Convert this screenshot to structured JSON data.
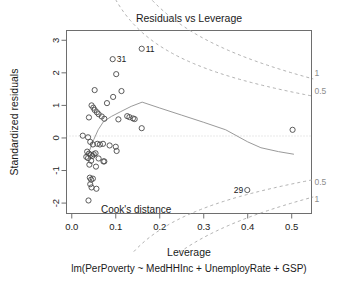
{
  "chart_data": {
    "type": "scatter",
    "title": "Residuals vs Leverage",
    "xlabel": "Leverage",
    "ylabel": "Standardized residuals",
    "subtitle": "lm(PerPoverty ~ MedHHInc + UnemployRate + GSP)",
    "xlim": [
      -0.012,
      0.545
    ],
    "ylim": [
      -2.32,
      3.3
    ],
    "xticks": [
      0.0,
      0.1,
      0.2,
      0.3,
      0.4,
      0.5
    ],
    "xtick_labels": [
      "0.0",
      "0.1",
      "0.2",
      "0.3",
      "0.4",
      "0.5"
    ],
    "yticks": [
      3,
      2,
      1,
      0,
      -1,
      -2
    ],
    "ytick_labels": [
      "3",
      "2",
      "1",
      "0",
      "-1",
      "-2"
    ],
    "grid": false,
    "legend": "none",
    "zero_reference_line": 0,
    "cooks_distance_annotation": "Cook's distance",
    "points": [
      {
        "x": 0.159,
        "y": 2.74,
        "label": "11"
      },
      {
        "x": 0.093,
        "y": 2.42,
        "label": "31"
      },
      {
        "x": 0.101,
        "y": 1.96,
        "label": ""
      },
      {
        "x": 0.113,
        "y": 1.44,
        "label": ""
      },
      {
        "x": 0.052,
        "y": 1.47,
        "label": ""
      },
      {
        "x": 0.094,
        "y": 1.26,
        "label": ""
      },
      {
        "x": 0.08,
        "y": 1.07,
        "label": ""
      },
      {
        "x": 0.045,
        "y": 1.0,
        "label": ""
      },
      {
        "x": 0.049,
        "y": 0.93,
        "label": ""
      },
      {
        "x": 0.052,
        "y": 0.86,
        "label": ""
      },
      {
        "x": 0.057,
        "y": 0.79,
        "label": ""
      },
      {
        "x": 0.061,
        "y": 0.73,
        "label": ""
      },
      {
        "x": 0.068,
        "y": 0.66,
        "label": ""
      },
      {
        "x": 0.039,
        "y": 0.63,
        "label": ""
      },
      {
        "x": 0.074,
        "y": 0.59,
        "label": ""
      },
      {
        "x": 0.106,
        "y": 0.57,
        "label": ""
      },
      {
        "x": 0.126,
        "y": 0.67,
        "label": ""
      },
      {
        "x": 0.131,
        "y": 0.64,
        "label": ""
      },
      {
        "x": 0.139,
        "y": 0.6,
        "label": ""
      },
      {
        "x": 0.143,
        "y": 0.58,
        "label": ""
      },
      {
        "x": 0.159,
        "y": 0.3,
        "label": ""
      },
      {
        "x": 0.502,
        "y": 0.25,
        "label": ""
      },
      {
        "x": 0.025,
        "y": 0.07,
        "label": ""
      },
      {
        "x": 0.037,
        "y": 0.02,
        "label": ""
      },
      {
        "x": 0.042,
        "y": -0.12,
        "label": ""
      },
      {
        "x": 0.048,
        "y": -0.2,
        "label": ""
      },
      {
        "x": 0.058,
        "y": -0.18,
        "label": ""
      },
      {
        "x": 0.064,
        "y": -0.2,
        "label": ""
      },
      {
        "x": 0.071,
        "y": -0.18,
        "label": ""
      },
      {
        "x": 0.086,
        "y": -0.23,
        "label": ""
      },
      {
        "x": 0.1,
        "y": -0.27,
        "label": ""
      },
      {
        "x": 0.102,
        "y": -0.4,
        "label": ""
      },
      {
        "x": 0.035,
        "y": -0.42,
        "label": ""
      },
      {
        "x": 0.039,
        "y": -0.48,
        "label": ""
      },
      {
        "x": 0.043,
        "y": -0.52,
        "label": ""
      },
      {
        "x": 0.047,
        "y": -0.55,
        "label": ""
      },
      {
        "x": 0.05,
        "y": -0.5,
        "label": ""
      },
      {
        "x": 0.054,
        "y": -0.47,
        "label": ""
      },
      {
        "x": 0.033,
        "y": -0.58,
        "label": ""
      },
      {
        "x": 0.037,
        "y": -0.62,
        "label": ""
      },
      {
        "x": 0.061,
        "y": -0.63,
        "label": ""
      },
      {
        "x": 0.044,
        "y": -0.7,
        "label": ""
      },
      {
        "x": 0.072,
        "y": -0.72,
        "label": ""
      },
      {
        "x": 0.074,
        "y": -0.72,
        "label": ""
      },
      {
        "x": 0.04,
        "y": -0.82,
        "label": ""
      },
      {
        "x": 0.055,
        "y": -0.88,
        "label": ""
      },
      {
        "x": 0.041,
        "y": -1.22,
        "label": ""
      },
      {
        "x": 0.044,
        "y": -1.28,
        "label": ""
      },
      {
        "x": 0.048,
        "y": -1.25,
        "label": ""
      },
      {
        "x": 0.042,
        "y": -1.42,
        "label": ""
      },
      {
        "x": 0.045,
        "y": -1.52,
        "label": ""
      },
      {
        "x": 0.056,
        "y": -1.56,
        "label": ""
      },
      {
        "x": 0.038,
        "y": -1.92,
        "label": ""
      },
      {
        "x": 0.399,
        "y": -1.6,
        "label": "29"
      }
    ],
    "smooth_line": [
      [
        0.031,
        -0.55
      ],
      [
        0.04,
        -0.4
      ],
      [
        0.05,
        -0.05
      ],
      [
        0.06,
        0.25
      ],
      [
        0.072,
        0.5
      ],
      [
        0.09,
        0.66
      ],
      [
        0.11,
        0.8
      ],
      [
        0.135,
        0.97
      ],
      [
        0.16,
        1.1
      ],
      [
        0.2,
        0.92
      ],
      [
        0.25,
        0.7
      ],
      [
        0.3,
        0.48
      ],
      [
        0.35,
        0.25
      ],
      [
        0.4,
        -0.12
      ],
      [
        0.43,
        -0.3
      ],
      [
        0.47,
        -0.42
      ],
      [
        0.505,
        -0.5
      ]
    ],
    "cooks_contours": [
      {
        "level": "1",
        "side": "upper",
        "label_y": 2.0
      },
      {
        "level": "0.5",
        "side": "upper",
        "label_y": 1.45
      },
      {
        "level": "0.5",
        "side": "lower",
        "label_y": -1.35
      },
      {
        "level": "1",
        "side": "lower",
        "label_y": -1.88
      }
    ]
  }
}
